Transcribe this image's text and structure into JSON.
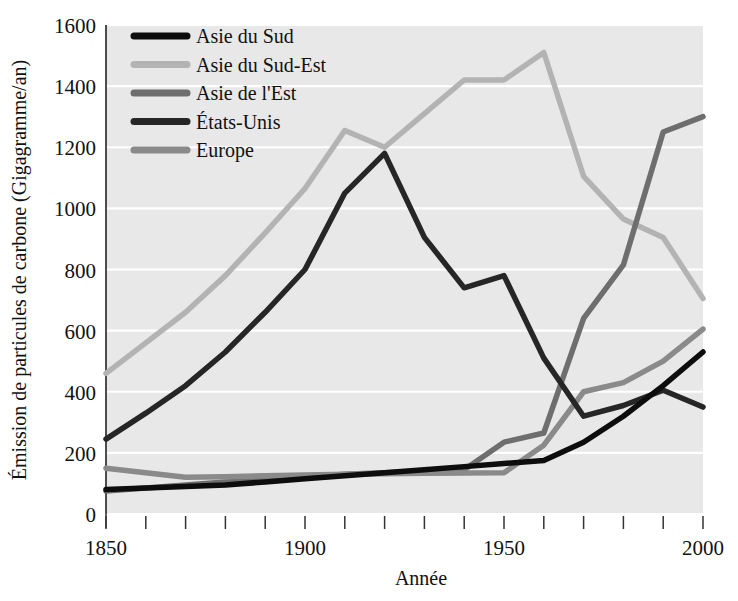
{
  "chart_data": {
    "type": "line",
    "title": "",
    "xlabel": "Année",
    "ylabel": "Émission de particules de carbone (Gigagramme/an)",
    "xlim": [
      1850,
      2000
    ],
    "ylim": [
      0,
      1600
    ],
    "xticks": [
      1850,
      1860,
      1870,
      1880,
      1890,
      1900,
      1910,
      1920,
      1930,
      1940,
      1950,
      1960,
      1970,
      1980,
      1990,
      2000
    ],
    "xtick_labels_shown": [
      "1850",
      "1900",
      "1950",
      "2000"
    ],
    "yticks": [
      0,
      200,
      400,
      600,
      800,
      1000,
      1200,
      1400,
      1600
    ],
    "ytick_labels": [
      "0",
      "200",
      "400",
      "600",
      "800",
      "1000",
      "1200",
      "1400",
      "1600"
    ],
    "grid": "horizontal-white",
    "legend_position": "top-left",
    "plot_background": "#e8e8e8",
    "figure_background": "#ffffff",
    "x": [
      1850,
      1860,
      1870,
      1880,
      1890,
      1900,
      1910,
      1920,
      1930,
      1940,
      1950,
      1960,
      1970,
      1980,
      1990,
      2000
    ],
    "series": [
      {
        "name": "Asie du Sud",
        "color": "#0d0d0d",
        "values": [
          80,
          85,
          90,
          95,
          105,
          115,
          125,
          135,
          145,
          155,
          165,
          175,
          235,
          320,
          420,
          530
        ]
      },
      {
        "name": "Asie du Sud-Est",
        "color": "#b3b3b3",
        "values": [
          460,
          560,
          660,
          780,
          920,
          1065,
          1255,
          1200,
          1310,
          1420,
          1420,
          1510,
          1105,
          965,
          905,
          705
        ]
      },
      {
        "name": "Asie de l'Est",
        "color": "#6e6e6e",
        "values": [
          75,
          85,
          95,
          105,
          110,
          120,
          130,
          135,
          140,
          145,
          235,
          265,
          640,
          815,
          1250,
          1300
        ]
      },
      {
        "name": "États-Unis",
        "color": "#262626",
        "values": [
          245,
          330,
          420,
          530,
          660,
          800,
          1050,
          1180,
          905,
          740,
          780,
          510,
          320,
          355,
          405,
          350
        ]
      },
      {
        "name": "Europe",
        "color": "#8a8a8a",
        "values": [
          150,
          135,
          120,
          122,
          125,
          128,
          130,
          132,
          133,
          134,
          135,
          225,
          400,
          430,
          500,
          605
        ]
      }
    ]
  },
  "legend": {
    "entries": [
      {
        "label": "Asie du Sud",
        "color": "#0d0d0d"
      },
      {
        "label": "Asie du Sud-Est",
        "color": "#b3b3b3"
      },
      {
        "label": "Asie de l'Est",
        "color": "#6e6e6e"
      },
      {
        "label": "États-Unis",
        "color": "#262626"
      },
      {
        "label": "Europe",
        "color": "#8a8a8a"
      }
    ]
  }
}
